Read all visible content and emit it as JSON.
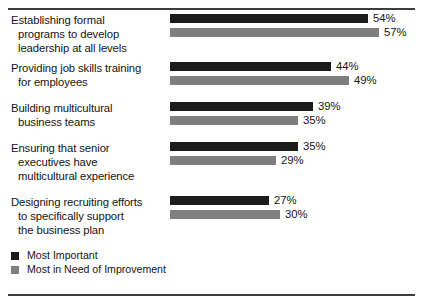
{
  "chart_data": {
    "type": "bar",
    "orientation": "horizontal",
    "title": "",
    "xlabel": "",
    "ylabel": "",
    "xlim": [
      0,
      60
    ],
    "grid": false,
    "legend_position": "bottom-left",
    "value_suffix": "%",
    "categories": [
      "Establishing formal\nprograms to develop\nleadership at all levels",
      "Providing job skills training\nfor employees",
      "Building multicultural\nbusiness teams",
      "Ensuring that senior\nexecutives have\nmulticultural experience",
      "Designing recruiting efforts\nto specifically support\nthe business plan"
    ],
    "series": [
      {
        "name": "Most Important",
        "color": "#1c1c1c",
        "values": [
          54,
          44,
          39,
          35,
          27
        ],
        "labels": [
          "54%",
          "44%",
          "39%",
          "35%",
          "27%"
        ]
      },
      {
        "name": "Most in Need of Improvement",
        "color": "#7f7f7f",
        "values": [
          57,
          49,
          35,
          29,
          30
        ],
        "labels": [
          "57%",
          "49%",
          "35%",
          "29%",
          "30%"
        ]
      }
    ]
  },
  "groups": [
    {
      "label": "Establishing formal\nprograms to develop\nleadership at all levels",
      "important_label": "54%",
      "improvement_label": "57%"
    },
    {
      "label": "Providing job skills training\nfor employees",
      "important_label": "44%",
      "improvement_label": "49%"
    },
    {
      "label": "Building multicultural\nbusiness teams",
      "important_label": "39%",
      "improvement_label": "35%"
    },
    {
      "label": "Ensuring that senior\nexecutives have\nmulticultural experience",
      "important_label": "35%",
      "improvement_label": "29%"
    },
    {
      "label": "Designing recruiting efforts\nto specifically support\nthe business plan",
      "important_label": "27%",
      "improvement_label": "30%"
    }
  ],
  "legend": {
    "items": [
      {
        "label": "Most Important",
        "color": "#1c1c1c"
      },
      {
        "label": "Most in Need of Improvement",
        "color": "#7f7f7f"
      }
    ]
  }
}
